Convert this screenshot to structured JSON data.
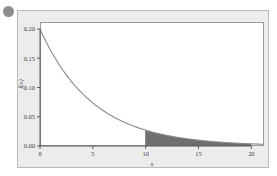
{
  "figure": {
    "bullet_icon": "bullet-dot",
    "background_color": "#ececec",
    "panel_color": "#ffffff",
    "border_color": "#9a9a9a"
  },
  "chart_data": {
    "type": "area",
    "title": "",
    "subtitle": "",
    "xlabel": "x",
    "ylabel": "f(x)",
    "xlim": [
      0,
      21.2
    ],
    "ylim": [
      0,
      0.212
    ],
    "xticks": [
      0,
      5,
      10,
      15,
      20
    ],
    "xticklabels": [
      "0",
      "5",
      "10",
      "15",
      "20"
    ],
    "yticks": [
      0.0,
      0.05,
      0.1,
      0.15,
      0.2
    ],
    "yticklabels": [
      "0.00",
      "0.05",
      "0.10",
      "0.15",
      "0.20"
    ],
    "grid": false,
    "legend": null,
    "curve_color": "#8a8a8a",
    "shade_color": "#6f6f6f",
    "series": [
      {
        "name": "exponential pdf",
        "function": "0.2*exp(-0.2*x)",
        "x": [
          0,
          1,
          2,
          3,
          4,
          5,
          6,
          7,
          8,
          9,
          10,
          11,
          12,
          13,
          14,
          15,
          16,
          17,
          18,
          19,
          20,
          21.2
        ],
        "values": [
          0.2,
          0.1637,
          0.134,
          0.1098,
          0.0899,
          0.0736,
          0.0602,
          0.0493,
          0.0404,
          0.0331,
          0.0271,
          0.0221,
          0.0181,
          0.0148,
          0.0121,
          0.01,
          0.0082,
          0.0067,
          0.0055,
          0.0045,
          0.0037,
          0.0029
        ]
      }
    ],
    "shaded_region": {
      "x_start": 10,
      "x_end": 20,
      "label": "tail area"
    }
  }
}
